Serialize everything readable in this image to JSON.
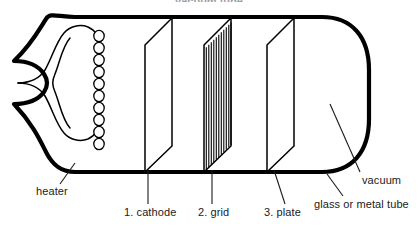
{
  "figure": {
    "title": "vacuum tube",
    "stroke_color": "#000000",
    "text_color": "#1a1a1a",
    "background_color": "#ffffff",
    "envelope_stroke_width": 4,
    "detail_stroke_width": 1.2
  },
  "labels": {
    "heater": "heater",
    "cathode": "1. cathode",
    "grid": "2. grid",
    "plate": "3. plate",
    "vacuum": "vacuum",
    "envelope": "glass or metal tube"
  },
  "components": {
    "heater": {
      "name": "heater",
      "shape": "hairpin-filament-with-coil",
      "coil_loop_count": 10
    },
    "cathode": {
      "name": "1. cathode",
      "number": 1,
      "shape": "parallelogram-plate"
    },
    "grid": {
      "name": "2. grid",
      "number": 2,
      "shape": "parallelogram-plate-with-wires",
      "wire_count": 11
    },
    "plate": {
      "name": "3. plate",
      "number": 3,
      "shape": "parallelogram-plate"
    },
    "envelope": {
      "name": "glass or metal tube",
      "shape": "rounded-d-end-with-pinched-stem"
    },
    "vacuum": {
      "name": "vacuum",
      "shape": "interior-region"
    }
  }
}
